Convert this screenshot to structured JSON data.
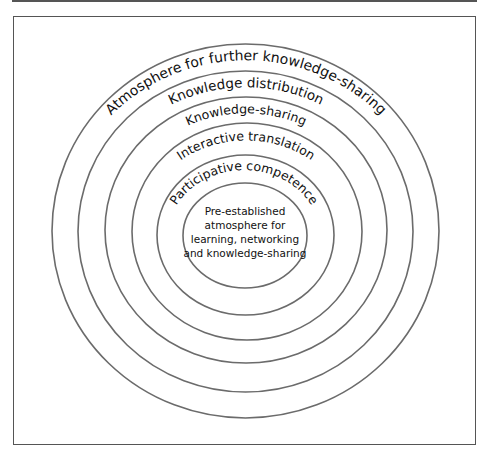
{
  "diagram": {
    "type": "concentric-circles",
    "core": {
      "lines": [
        "Pre-established",
        "atmosphere for",
        "learning, networking",
        "and knowledge-sharing"
      ]
    },
    "rings": [
      {
        "label": "Participative competence"
      },
      {
        "label": "Interactive translation"
      },
      {
        "label": "Knowledge-sharing"
      },
      {
        "label": "Knowledge distribution"
      },
      {
        "label": "Atmosphere for further knowledge-sharing"
      }
    ],
    "colors": {
      "ring_stroke": "#6b6b6b",
      "text": "#111111",
      "frame": "#555555"
    }
  }
}
